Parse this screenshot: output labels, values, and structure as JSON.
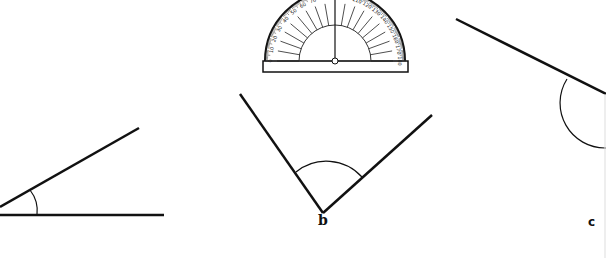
{
  "figure": {
    "protractor": {
      "scale_labels": [
        "0",
        "10",
        "20",
        "30",
        "40",
        "50",
        "60",
        "70",
        "80",
        "90",
        "100",
        "110",
        "120",
        "130",
        "140",
        "150",
        "160",
        "170",
        "180"
      ]
    },
    "angles": [
      {
        "id": "a",
        "label": "",
        "type": "acute"
      },
      {
        "id": "b",
        "label": "b",
        "type": "acute"
      },
      {
        "id": "c",
        "label": "c",
        "type": "obtuse"
      }
    ]
  }
}
